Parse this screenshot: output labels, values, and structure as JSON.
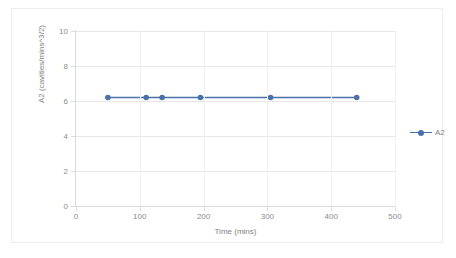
{
  "chart_data": {
    "type": "line",
    "title": "",
    "xlabel": "Time (mins)",
    "ylabel": "A2 (cavities/mins^3/2)",
    "xlim": [
      0,
      500
    ],
    "ylim": [
      0,
      10
    ],
    "xticks": [
      "0",
      "100",
      "200",
      "300",
      "400",
      "500"
    ],
    "xtick_values": [
      0,
      100,
      200,
      300,
      400,
      500
    ],
    "yticks": [
      "0",
      "2",
      "4",
      "6",
      "8",
      "10"
    ],
    "ytick_values": [
      0,
      2,
      4,
      6,
      8,
      10
    ],
    "grid": "horizontal-and-vertical",
    "legend_position": "right",
    "series": [
      {
        "name": "A2",
        "color": "#4a72a8",
        "marker": "circle",
        "x": [
          50,
          110,
          135,
          195,
          305,
          440
        ],
        "values": [
          6.2,
          6.2,
          6.2,
          6.2,
          6.2,
          6.2
        ]
      }
    ]
  },
  "legend": {
    "entries": [
      {
        "label": "A2",
        "color": "#4a72a8"
      }
    ]
  },
  "colors": {
    "series": "#4a72a8",
    "grid": "#e6e7e8",
    "axis": "#d9dadb",
    "text": "#8a8c8e",
    "frame": "#eceded"
  }
}
